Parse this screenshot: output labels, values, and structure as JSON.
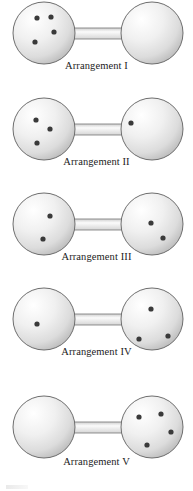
{
  "figure": {
    "width": 193,
    "height": 491,
    "background_color": "#ffffff",
    "sphere_fill_light": "#fdfdfd",
    "sphere_fill_mid": "#e8e8e8",
    "sphere_fill_shadow": "#b9b9b9",
    "outline_color": "#6e6e6e",
    "particle_color": "#3a3a3a",
    "label_color": "#1c1c1c",
    "total_particles": 4
  },
  "arrangements": [
    {
      "id": "arrangement-1",
      "label": "Arrangement I",
      "left_count": 4,
      "right_count": 0,
      "left_particles": [
        {
          "cx": 37,
          "cy": 18
        },
        {
          "cx": 51,
          "cy": 17
        },
        {
          "cx": 54,
          "cy": 32
        },
        {
          "cx": 35,
          "cy": 42
        }
      ],
      "right_particles": []
    },
    {
      "id": "arrangement-2",
      "label": "Arrangement II",
      "left_count": 3,
      "right_count": 1,
      "left_particles": [
        {
          "cx": 36,
          "cy": 24
        },
        {
          "cx": 50,
          "cy": 33
        },
        {
          "cx": 37,
          "cy": 47
        }
      ],
      "right_particles": [
        {
          "cx": 131,
          "cy": 27
        }
      ]
    },
    {
      "id": "arrangement-3",
      "label": "Arrangement III",
      "left_count": 2,
      "right_count": 2,
      "left_particles": [
        {
          "cx": 50,
          "cy": 25
        },
        {
          "cx": 43,
          "cy": 48
        }
      ],
      "right_particles": [
        {
          "cx": 151,
          "cy": 32
        },
        {
          "cx": 163,
          "cy": 47
        }
      ]
    },
    {
      "id": "arrangement-4",
      "label": "Arrangement IV",
      "left_count": 1,
      "right_count": 3,
      "left_particles": [
        {
          "cx": 37,
          "cy": 38
        }
      ],
      "right_particles": [
        {
          "cx": 151,
          "cy": 23
        },
        {
          "cx": 139,
          "cy": 53
        },
        {
          "cx": 168,
          "cy": 50
        }
      ]
    },
    {
      "id": "arrangement-5",
      "label": "Arrangement V",
      "left_count": 0,
      "right_count": 4,
      "left_particles": [],
      "right_particles": [
        {
          "cx": 139,
          "cy": 36
        },
        {
          "cx": 161,
          "cy": 33
        },
        {
          "cx": 171,
          "cy": 51
        },
        {
          "cx": 147,
          "cy": 64
        }
      ]
    }
  ],
  "geometry": {
    "left_center_x": 44,
    "right_center_x": 152,
    "center_y": 33,
    "sphere_radius": 32,
    "tube_half_height": 5
  }
}
